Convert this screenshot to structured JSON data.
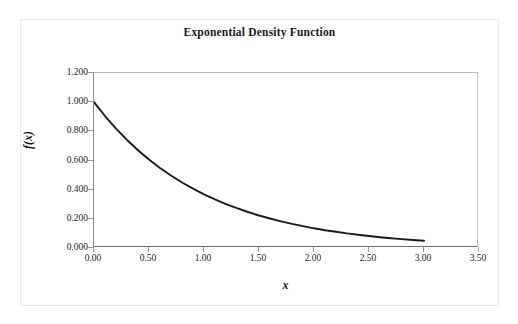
{
  "chart_data": {
    "type": "line",
    "title": "Exponential Density Function",
    "xlabel": "x",
    "ylabel": "f(x)",
    "xlim": [
      0.0,
      3.5
    ],
    "ylim": [
      0.0,
      1.2
    ],
    "grid": false,
    "legend": false,
    "legend_position": "none",
    "line_color": "#1a1a1a",
    "background_color": "#ffffff",
    "plot_border_color": "#9a9a9e",
    "xticks": [
      "0.00",
      "0.50",
      "1.00",
      "1.50",
      "2.00",
      "2.50",
      "3.00",
      "3.50"
    ],
    "xtick_values": [
      0.0,
      0.5,
      1.0,
      1.5,
      2.0,
      2.5,
      3.0,
      3.5
    ],
    "yticks": [
      "0.000",
      "0.200",
      "0.400",
      "0.600",
      "0.800",
      "1.000",
      "1.200"
    ],
    "ytick_values": [
      0.0,
      0.2,
      0.4,
      0.6,
      0.8,
      1.0,
      1.2
    ],
    "series": [
      {
        "name": "f(x) = e^(-x)",
        "x": [
          0.0,
          0.1,
          0.2,
          0.3,
          0.4,
          0.5,
          0.6,
          0.7,
          0.8,
          0.9,
          1.0,
          1.1,
          1.2,
          1.3,
          1.4,
          1.5,
          1.6,
          1.7,
          1.8,
          1.9,
          2.0,
          2.1,
          2.2,
          2.3,
          2.4,
          2.5,
          2.6,
          2.7,
          2.8,
          2.9,
          3.0
        ],
        "values": [
          1.0,
          0.905,
          0.819,
          0.741,
          0.67,
          0.607,
          0.549,
          0.497,
          0.449,
          0.407,
          0.368,
          0.333,
          0.301,
          0.273,
          0.247,
          0.223,
          0.202,
          0.183,
          0.165,
          0.15,
          0.135,
          0.122,
          0.111,
          0.1,
          0.091,
          0.082,
          0.074,
          0.067,
          0.061,
          0.055,
          0.05
        ]
      }
    ]
  }
}
